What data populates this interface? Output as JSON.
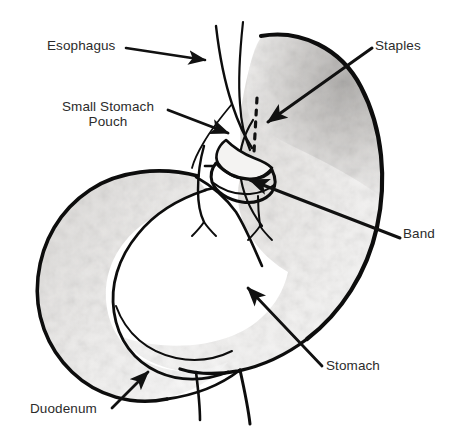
{
  "figure": {
    "style": "black and white scanned line drawing with gray shading",
    "background_color": "#ffffff",
    "line_color": "#000000",
    "text_color": "#2b2b2b",
    "shading_color": "#d8d6d4"
  },
  "labels": [
    {
      "id": "esophagus",
      "text": "Esophagus",
      "position": "top-left",
      "arrow_direction": "right",
      "points_to": "esophagus tube"
    },
    {
      "id": "small_stomach_pouch",
      "text": "Small Stomach\nPouch",
      "line1": "Small Stomach",
      "line2": "Pouch",
      "position": "upper-left",
      "arrow_direction": "right-down",
      "points_to": "small stomach pouch below esophagus"
    },
    {
      "id": "staples",
      "text": "Staples",
      "position": "top-right",
      "arrow_direction": "left-down",
      "points_to": "dashed vertical staple line"
    },
    {
      "id": "band",
      "text": "Band",
      "position": "middle-right",
      "arrow_direction": "left-up",
      "points_to": "band ring at pouch outlet"
    },
    {
      "id": "stomach",
      "text": "Stomach",
      "position": "bottom-right",
      "arrow_direction": "left-up",
      "points_to": "main stomach body"
    },
    {
      "id": "duodenum",
      "text": "Duodenum",
      "position": "bottom-left",
      "arrow_direction": "right-up",
      "points_to": "duodenum loop"
    }
  ],
  "anatomy_parts": [
    {
      "id": "esophagus",
      "name": "Esophagus"
    },
    {
      "id": "small_stomach_pouch",
      "name": "Small Stomach Pouch"
    },
    {
      "id": "staple_line",
      "name": "Staples",
      "rendering": "dashed vertical line"
    },
    {
      "id": "band",
      "name": "Band",
      "rendering": "ring around pouch outlet"
    },
    {
      "id": "stomach",
      "name": "Stomach",
      "rendering": "large shaded body"
    },
    {
      "id": "duodenum",
      "name": "Duodenum",
      "rendering": "C-shaped loop at left"
    }
  ]
}
